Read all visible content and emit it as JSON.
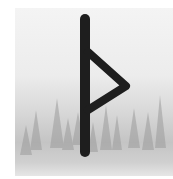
{
  "image": {
    "subject": "Thurisaz rune",
    "background": "misty pine forest watercolor",
    "colors": {
      "rune": "#1e1e1e",
      "sky": "#f2f2f2",
      "trees": "#9a9a9a",
      "ground": "#cfcfcf"
    }
  }
}
